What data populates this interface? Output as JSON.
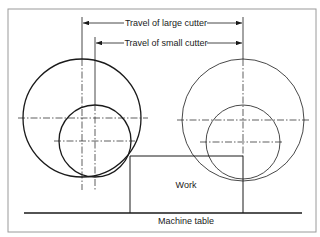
{
  "diagram": {
    "type": "milling-cutter-travel-comparison",
    "labels": {
      "travel_large": "Travel of large cutter",
      "travel_small": "Travel of small cutter",
      "work": "Work",
      "machine_table": "Machine table"
    },
    "colors": {
      "ink": "#1a1a1a",
      "frame": "#9a9a9a",
      "background": "#ffffff"
    },
    "nodes": [
      {
        "id": "large-cutter-start",
        "shape": "circle",
        "cx": 82,
        "cy": 118,
        "r": 59,
        "position": "start"
      },
      {
        "id": "small-cutter-start",
        "shape": "circle",
        "cx": 95,
        "cy": 141,
        "r": 36,
        "position": "start"
      },
      {
        "id": "large-cutter-end",
        "shape": "circle",
        "cx": 243,
        "cy": 120,
        "r": 61,
        "position": "end"
      },
      {
        "id": "small-cutter-end",
        "shape": "circle",
        "cx": 243,
        "cy": 142,
        "r": 37,
        "position": "end"
      },
      {
        "id": "work",
        "shape": "rect",
        "x": 130,
        "y": 156,
        "w": 113,
        "h": 57,
        "label": "Work"
      },
      {
        "id": "machine-table",
        "shape": "line",
        "x1": 24,
        "x2": 302,
        "y": 213,
        "label": "Machine table"
      }
    ],
    "dimensions": [
      {
        "id": "travel-large",
        "label": "Travel of large cutter",
        "from_x": 82,
        "to_x": 243,
        "y": 23
      },
      {
        "id": "travel-small",
        "label": "Travel of small cutter",
        "from_x": 95,
        "to_x": 243,
        "y": 43
      }
    ]
  }
}
